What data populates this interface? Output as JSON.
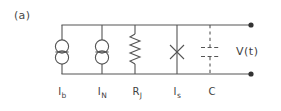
{
  "figure": {
    "panel_label": "(a)",
    "output_label": "V(t)",
    "stroke_color": "#555555",
    "text_color": "#3f3f3f",
    "background_color": "#ffffff",
    "branches": [
      {
        "id": "bias-current-source",
        "symbol": "current-source",
        "label": "I",
        "sublabel": "b",
        "x": 62
      },
      {
        "id": "noise-current-source",
        "symbol": "current-source",
        "label": "I",
        "sublabel": "N",
        "x": 102
      },
      {
        "id": "junction-resistance",
        "symbol": "resistor",
        "label": "R",
        "sublabel": "J",
        "x": 135
      },
      {
        "id": "supercurrent-junction",
        "symbol": "josephson-junction",
        "label": "I",
        "sublabel": "s",
        "x": 177
      },
      {
        "id": "capacitance",
        "symbol": "capacitor",
        "label": "C",
        "sublabel": "",
        "x": 210
      }
    ],
    "terminals": [
      {
        "id": "top-terminal",
        "x": 251,
        "y": 25
      },
      {
        "id": "bottom-terminal",
        "x": 251,
        "y": 74
      }
    ],
    "rails": {
      "top_y": 25,
      "bottom_y": 74,
      "left_x": 62,
      "right_x": 251
    }
  }
}
